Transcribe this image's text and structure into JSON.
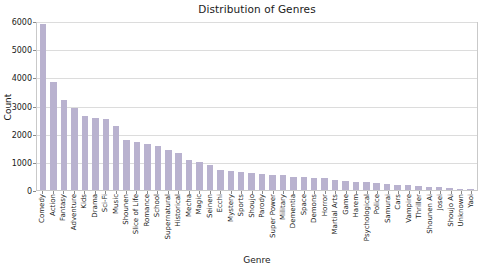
{
  "chart_data": {
    "type": "bar",
    "title": "Distribution of Genres",
    "xlabel": "Genre",
    "ylabel": "Count",
    "ylim": [
      0,
      6000
    ],
    "yticks": [
      0,
      1000,
      2000,
      3000,
      4000,
      5000,
      6000
    ],
    "ytick_labels": [
      "0",
      "1000",
      "2000",
      "3000",
      "4000",
      "5000",
      "6000"
    ],
    "grid": true,
    "grid_axis": "y",
    "legend": null,
    "bar_color": "#b9b2cf",
    "categories": [
      "Comedy",
      "Action",
      "Fantasy",
      "Adventure",
      "Kids",
      "Drama",
      "Sci-Fi",
      "Music",
      "Shounen",
      "Slice of Life",
      "Romance",
      "School",
      "Supernatural",
      "Historical",
      "Mecha",
      "Magic",
      "Seinen",
      "Ecchi",
      "Mystery",
      "Sports",
      "Shoujo",
      "Parody",
      "Super Power",
      "Military",
      "Dementia",
      "Space",
      "Demons",
      "Horror",
      "Martial Arts",
      "Game",
      "Harem",
      "Psychological",
      "Police",
      "Samurai",
      "Cars",
      "Vampire",
      "Thriller",
      "Shounen Ai",
      "Josei",
      "Shoujo Ai",
      "Unknown",
      "Yaoi"
    ],
    "values": [
      5900,
      3830,
      3180,
      2920,
      2620,
      2560,
      2530,
      2260,
      1780,
      1710,
      1640,
      1570,
      1430,
      1320,
      1080,
      1010,
      880,
      700,
      660,
      640,
      600,
      560,
      540,
      520,
      470,
      450,
      430,
      410,
      360,
      330,
      300,
      290,
      250,
      220,
      190,
      170,
      140,
      110,
      95,
      70,
      45,
      25
    ]
  }
}
